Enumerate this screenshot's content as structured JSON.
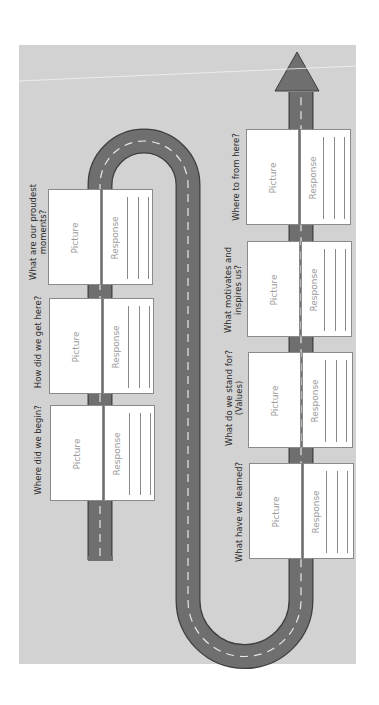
{
  "diagram": {
    "type": "road-journey-worksheet",
    "orientation": "rotated-90-ccw",
    "colors": {
      "background": "#ffffff",
      "panel": "#d2d2d2",
      "road": "#6f6f6f",
      "road_outline": "#3e3e3e",
      "lane_dash": "#e6e6e6",
      "card": "#ffffff",
      "card_border": "#8a8a8a",
      "placeholder_text": "#9a9a9a",
      "question_text": "#2b2b2b"
    },
    "stops": [
      {
        "order": 1,
        "question": "Where did we begin?",
        "picture_label": "Picture",
        "response_label": "Response"
      },
      {
        "order": 2,
        "question": "How did we get here?",
        "picture_label": "Picture",
        "response_label": "Response"
      },
      {
        "order": 3,
        "question": "What are our proudest moments?",
        "question_lines": [
          "What are our proudest",
          "moments?"
        ],
        "picture_label": "Picture",
        "response_label": "Response"
      },
      {
        "order": 4,
        "question": "What have we learned?",
        "picture_label": "Picture",
        "response_label": "Response"
      },
      {
        "order": 5,
        "question": "What do we stand for? (Values)",
        "question_lines": [
          "What do we stand for?",
          "(Values)"
        ],
        "picture_label": "Picture",
        "response_label": "Response"
      },
      {
        "order": 6,
        "question": "What motivates and inspires us?",
        "question_lines": [
          "What motivates and",
          "inspires us?"
        ],
        "picture_label": "Picture",
        "response_label": "Response"
      },
      {
        "order": 7,
        "question": "Where to from here?",
        "picture_label": "Picture",
        "response_label": "Response"
      }
    ],
    "end_marker": "arrow-up"
  }
}
